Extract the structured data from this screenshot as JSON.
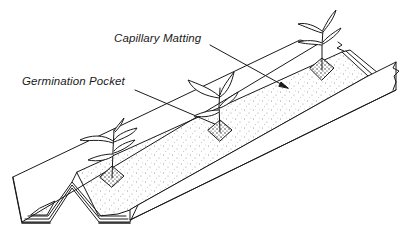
{
  "figure": {
    "type": "technical line drawing",
    "labels": [
      {
        "id": "capillary_matting",
        "text": "Capillary Matting"
      },
      {
        "id": "germination_pocket",
        "text": "Germination Pocket"
      }
    ],
    "plants_count": 3,
    "colors": {
      "ink": "#1a1a1a",
      "background": "#ffffff"
    }
  }
}
